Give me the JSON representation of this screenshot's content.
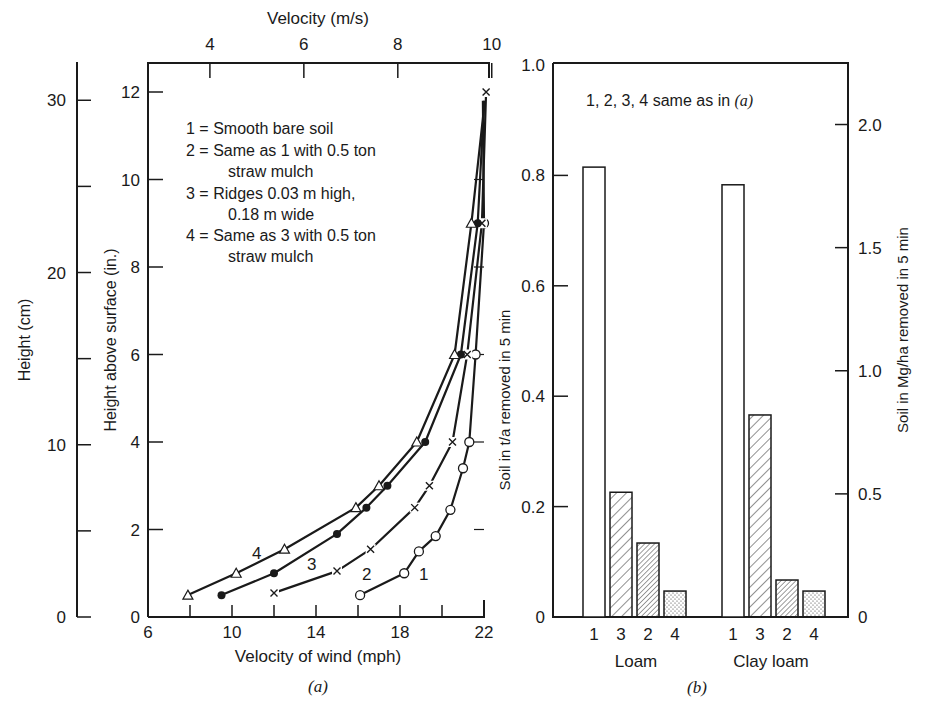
{
  "panel_a": {
    "top_axis_title": "Velocity (m/s)",
    "top_ticks": [
      "4",
      "6",
      "8",
      "10"
    ],
    "left_outer_title": "Height (cm)",
    "left_outer_ticks": [
      "0",
      "10",
      "20",
      "30"
    ],
    "left_inner_title": "Height above surface (in.)",
    "left_inner_ticks": [
      "0",
      "2",
      "4",
      "6",
      "8",
      "10",
      "12"
    ],
    "bottom_ticks": [
      "6",
      "10",
      "14",
      "18",
      "22"
    ],
    "bottom_axis_title": "Velocity of wind (mph)",
    "caption": "(a)",
    "legend": [
      "1 = Smooth bare soil",
      "2 = Same as 1 with 0.5 ton",
      "straw mulch",
      "3 = Ridges 0.03 m high,",
      "0.18 m wide",
      "4 = Same as 3 with 0.5 ton",
      "straw mulch"
    ],
    "curve_labels": [
      "1",
      "2",
      "3",
      "4"
    ]
  },
  "panel_b": {
    "note": "1, 2, 3, 4 same as in ",
    "note_italic": "(a)",
    "left_axis_title": "Soil in t/a removed in 5 min",
    "left_ticks": [
      "0",
      "0.2",
      "0.4",
      "0.6",
      "0.8",
      "1.0"
    ],
    "right_axis_title": "Soil in Mg/ha removed in 5 min",
    "right_ticks": [
      "0",
      "0.5",
      "1.0",
      "1.5",
      "2.0"
    ],
    "bar_labels": [
      "1",
      "3",
      "2",
      "4"
    ],
    "group_labels": [
      "Loam",
      "Clay loam"
    ],
    "caption": "(b)"
  },
  "chart_data": [
    {
      "type": "line",
      "title": "(a) Wind velocity profiles above soil surface",
      "xlabel": "Velocity of wind (mph)",
      "x2label": "Velocity (m/s)",
      "ylabel": "Height above surface (in.)",
      "y2label": "Height (cm)",
      "xlim": [
        6,
        22
      ],
      "ylim": [
        0,
        12.5
      ],
      "x_ticks": [
        6,
        10,
        14,
        18,
        22
      ],
      "x2_ticks": [
        4,
        6,
        8,
        10
      ],
      "y_ticks": [
        0,
        2,
        4,
        6,
        8,
        10,
        12
      ],
      "y2_ticks": [
        0,
        10,
        20,
        30
      ],
      "grid": false,
      "legend_position": "upper left (inside)",
      "series": [
        {
          "name": "1 = Smooth bare soil",
          "marker": "open circle",
          "points": [
            [
              16.1,
              0.5
            ],
            [
              18.2,
              1.0
            ],
            [
              18.9,
              1.5
            ],
            [
              19.7,
              1.85
            ],
            [
              20.4,
              2.45
            ],
            [
              21.0,
              3.4
            ],
            [
              21.3,
              4.0
            ],
            [
              21.6,
              6.0
            ],
            [
              22.0,
              9.0
            ]
          ]
        },
        {
          "name": "2 = Same as 1 with 0.5 ton straw mulch",
          "marker": "x",
          "points": [
            [
              12.0,
              0.55
            ],
            [
              15.0,
              1.05
            ],
            [
              16.6,
              1.55
            ],
            [
              18.7,
              2.5
            ],
            [
              19.4,
              3.0
            ],
            [
              20.5,
              4.0
            ],
            [
              21.2,
              6.0
            ],
            [
              21.9,
              9.0
            ],
            [
              22.1,
              12.0
            ]
          ]
        },
        {
          "name": "3 = Ridges 0.03 m high, 0.18 m wide",
          "marker": "filled circle",
          "points": [
            [
              9.5,
              0.5
            ],
            [
              12.0,
              1.0
            ],
            [
              15.0,
              1.9
            ],
            [
              16.4,
              2.5
            ],
            [
              17.4,
              3.0
            ],
            [
              19.2,
              4.0
            ],
            [
              20.9,
              6.0
            ],
            [
              21.7,
              9.0
            ]
          ]
        },
        {
          "name": "4 = Same as 3 with 0.5 ton straw mulch",
          "marker": "open triangle",
          "points": [
            [
              7.9,
              0.5
            ],
            [
              10.2,
              1.0
            ],
            [
              12.5,
              1.55
            ],
            [
              15.9,
              2.5
            ],
            [
              17.0,
              3.0
            ],
            [
              18.8,
              4.0
            ],
            [
              20.6,
              6.0
            ],
            [
              21.4,
              9.0
            ]
          ]
        }
      ]
    },
    {
      "type": "bar",
      "title": "(b) Soil removed in 5 min",
      "annotation": "1, 2, 3, 4 same as in (a)",
      "categories": [
        "Loam",
        "Clay loam"
      ],
      "bar_order": [
        "1",
        "3",
        "2",
        "4"
      ],
      "ylabel": "Soil in t/a removed in 5 min",
      "y2label": "Soil in Mg/ha removed in 5 min",
      "ylim": [
        0,
        1.0
      ],
      "y2lim": [
        0,
        2.24
      ],
      "series": [
        {
          "name": "1",
          "pattern": "open",
          "values": [
            0.815,
            0.783
          ]
        },
        {
          "name": "3",
          "pattern": "wide hatch",
          "values": [
            0.226,
            0.366
          ]
        },
        {
          "name": "2",
          "pattern": "dense hatch",
          "values": [
            0.134,
            0.067
          ]
        },
        {
          "name": "4",
          "pattern": "stipple",
          "values": [
            0.047,
            0.047
          ]
        }
      ]
    }
  ]
}
